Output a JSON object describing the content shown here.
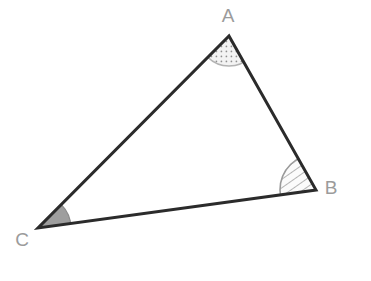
{
  "figure": {
    "type": "geometry-diagram",
    "shape": "triangle",
    "background_color": "#ffffff",
    "canvas": {
      "width": 371,
      "height": 281
    },
    "stroke": {
      "color": "#2b2b2b",
      "width": 3
    },
    "vertices": [
      {
        "id": "A",
        "label": "A",
        "x": 229,
        "y": 36,
        "label_x": 228,
        "label_y": 17
      },
      {
        "id": "B",
        "label": "B",
        "x": 316,
        "y": 190,
        "label_x": 331,
        "label_y": 189
      },
      {
        "id": "C",
        "label": "C",
        "x": 38,
        "y": 228,
        "label_x": 22,
        "label_y": 241
      }
    ],
    "sides": [
      {
        "id": "AB",
        "from": "A",
        "to": "B"
      },
      {
        "id": "BC",
        "from": "B",
        "to": "C"
      },
      {
        "id": "CA",
        "from": "C",
        "to": "A"
      }
    ],
    "angle_markers": [
      {
        "at": "A",
        "fill_style": "dotted",
        "fill_color": "#f2f2f2",
        "dot_color": "#8c8c8c",
        "arc_color": "#b4b4b4",
        "radius": 30
      },
      {
        "at": "B",
        "fill_style": "hatched",
        "fill_color": "#fafafa",
        "hatch_color": "#8a8a8a",
        "arc_color": "#9a9a9a",
        "radius": 36
      },
      {
        "at": "C",
        "fill_style": "solid",
        "fill_color": "#9e9e9e",
        "arc_color": "#8a8a8a",
        "radius": 33
      }
    ],
    "label_color": "#9b9b9b"
  }
}
